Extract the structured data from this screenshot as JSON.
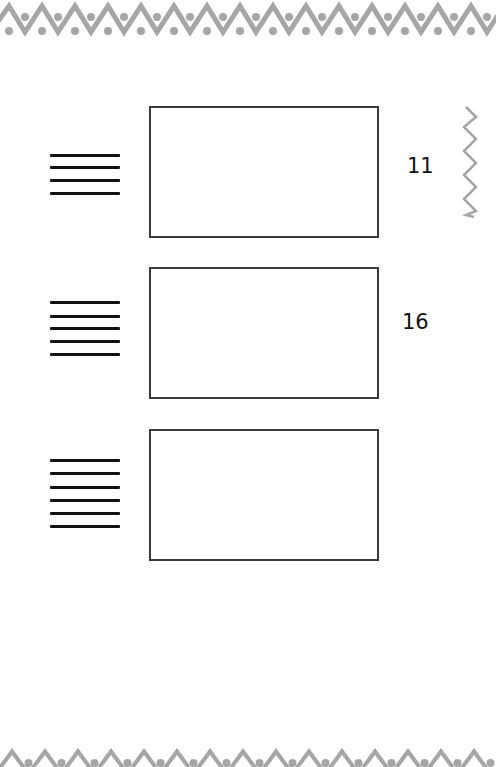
{
  "worksheet": {
    "rows": [
      {
        "line_count": 4,
        "answer": "11"
      },
      {
        "line_count": 5,
        "answer": "16"
      },
      {
        "line_count": 6,
        "answer": ""
      }
    ]
  },
  "colors": {
    "border_pattern": "#a6a6a6",
    "lines": "#111111",
    "box_border": "#3a3a3a"
  }
}
